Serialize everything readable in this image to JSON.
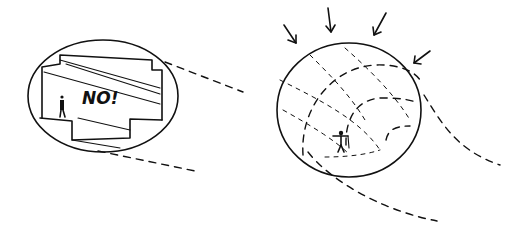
{
  "left_sketch": {
    "description": "Enclosed rectangular room inside an ellipse, with a tiny standing figure",
    "annotation": "NO!"
  },
  "right_sketch": {
    "description": "Dome-like ellipse with dashed curved grid, a figure with outstretched arms, arrows pointing inward from above",
    "arrow_count": 4
  },
  "colors": {
    "ink": "#111111",
    "background": "#ffffff"
  }
}
